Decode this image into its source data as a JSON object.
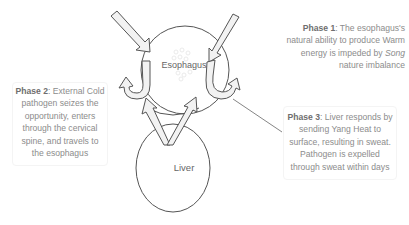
{
  "diagram": {
    "organs": {
      "esophagus": {
        "label": "Esophagus"
      },
      "liver": {
        "label": "Liver"
      }
    },
    "phases": [
      {
        "id": "phase1",
        "title": "Phase 1",
        "text_pre": ": The esophagus's natural ability to produce Warm energy is impeded by ",
        "emphasis": "Song",
        "text_post": " nature imbalance"
      },
      {
        "id": "phase2",
        "title": "Phase 2",
        "text": ": External Cold pathogen seizes the opportunity, enters through the cervical spine, and travels to the esophagus"
      },
      {
        "id": "phase3",
        "title": "Phase 3",
        "text": ": Liver responds by sending Yang Heat to surface, resulting in sweat. Pathogen is expelled through sweat within days"
      }
    ],
    "colors": {
      "stroke": "#555555",
      "arrow_fill": "#f2f2f2",
      "text": "#8c8c8c",
      "title_text": "#6e6e6e"
    }
  }
}
